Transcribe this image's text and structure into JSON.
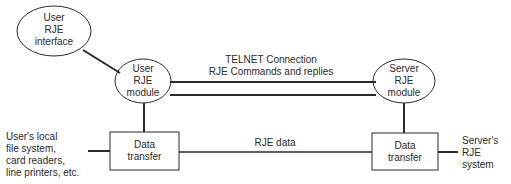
{
  "diagram": {
    "type": "block-diagram",
    "colors": {
      "stroke": "#2a2a2a",
      "background": "#ffffff",
      "text": "#2a2a2a"
    },
    "nodes": {
      "user_interface": {
        "shape": "ellipse",
        "lines": [
          "User",
          "RJE",
          "interface"
        ]
      },
      "user_module": {
        "shape": "ellipse",
        "lines": [
          "User",
          "RJE",
          "module"
        ]
      },
      "server_module": {
        "shape": "ellipse",
        "lines": [
          "Server",
          "RJE",
          "module"
        ]
      },
      "user_transfer": {
        "shape": "rectangle",
        "lines": [
          "Data",
          "transfer"
        ]
      },
      "server_transfer": {
        "shape": "rectangle",
        "lines": [
          "Data",
          "transfer"
        ]
      }
    },
    "connections": {
      "telnet": {
        "lines": [
          "TELNET Connection",
          "RJE Commands and replies"
        ],
        "style": "double-line"
      },
      "rje_data": {
        "label": "RJE data",
        "style": "single-line"
      }
    },
    "external": {
      "user_local": {
        "lines": [
          "User's local",
          "file system,",
          "card readers,",
          "line printers, etc."
        ]
      },
      "server_system": {
        "lines": [
          "Server's",
          "RJE",
          "system"
        ]
      }
    },
    "edges": [
      {
        "from": "user_interface",
        "to": "user_module"
      },
      {
        "from": "user_module",
        "to": "server_module",
        "label": "telnet"
      },
      {
        "from": "user_module",
        "to": "user_transfer"
      },
      {
        "from": "server_module",
        "to": "server_transfer"
      },
      {
        "from": "user_transfer",
        "to": "server_transfer",
        "label": "rje_data"
      },
      {
        "from": "user_local",
        "to": "user_transfer"
      },
      {
        "from": "server_transfer",
        "to": "server_system"
      }
    ]
  }
}
